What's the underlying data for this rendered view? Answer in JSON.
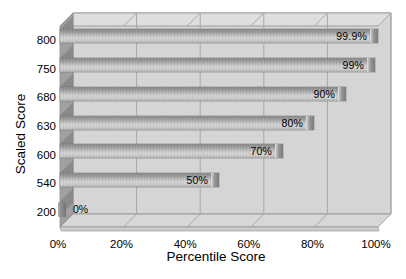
{
  "chart_data": {
    "type": "bar",
    "orientation": "horizontal",
    "title": "",
    "xlabel": "Percentile Score",
    "ylabel": "Scaled Score",
    "categories": [
      "800",
      "750",
      "680",
      "630",
      "600",
      "540",
      "200"
    ],
    "values": [
      99.9,
      99,
      90,
      80,
      70,
      50,
      0
    ],
    "bar_labels": [
      "99.9%",
      "99%",
      "90%",
      "80%",
      "70%",
      "50%",
      "0%"
    ],
    "x_ticks": [
      {
        "value": 0,
        "label": "0%"
      },
      {
        "value": 20,
        "label": "20%"
      },
      {
        "value": 40,
        "label": "40%"
      },
      {
        "value": 60,
        "label": "60%"
      },
      {
        "value": 80,
        "label": "80%"
      },
      {
        "value": 100,
        "label": "100%"
      }
    ],
    "xlim": [
      0,
      100
    ],
    "grid": true,
    "legend": "none",
    "style": "3d-gray-excel",
    "colors": {
      "background": "#ffffff",
      "text": "#000000",
      "back_wall": "#d5d5d5",
      "roof": "#dedede",
      "floor": "#d7d7d7",
      "floor_edge": "#cccccc",
      "side_wall": "#a0a0a0",
      "wall_mark": "#8a8a8a",
      "gridline": "#a8a8a8",
      "frame_stroke": "#8f8f8f"
    }
  }
}
